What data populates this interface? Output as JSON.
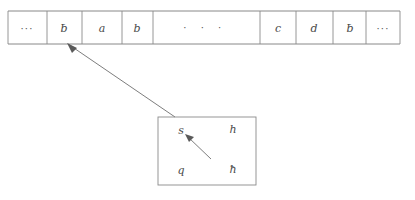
{
  "figure": {
    "kind": "turing-machine-tape-diagram",
    "background_color": "#ffffff",
    "line_color": "#8a8a8a",
    "text_color": "#4a4a4a"
  },
  "tape": {
    "name": "turing-machine-tape",
    "left_x": 8,
    "right_x": 400,
    "top_y": 11,
    "bottom_y": 44,
    "cells": [
      {
        "id": "cell-left-ellipsis",
        "symbol": "···",
        "kind": "ellipsis",
        "x_start": 8,
        "x_end": 47
      },
      {
        "id": "cell-blank-left",
        "symbol": "ƀ",
        "kind": "blank",
        "x_start": 47,
        "x_end": 82
      },
      {
        "id": "cell-a",
        "symbol": "a",
        "kind": "letter",
        "x_start": 82,
        "x_end": 122
      },
      {
        "id": "cell-b",
        "symbol": "b",
        "kind": "letter",
        "x_start": 122,
        "x_end": 153
      },
      {
        "id": "cell-middle-ellipsis",
        "symbol": "· · ·",
        "kind": "wide-ellipsis",
        "x_start": 153,
        "x_end": 260
      },
      {
        "id": "cell-c",
        "symbol": "c",
        "kind": "letter",
        "x_start": 260,
        "x_end": 296
      },
      {
        "id": "cell-d",
        "symbol": "d",
        "kind": "letter",
        "x_start": 296,
        "x_end": 333
      },
      {
        "id": "cell-blank-right",
        "symbol": "ƀ",
        "kind": "blank",
        "x_start": 333,
        "x_end": 366
      },
      {
        "id": "cell-right-ellipsis",
        "symbol": "···",
        "kind": "ellipsis",
        "x_start": 366,
        "x_end": 400
      }
    ]
  },
  "leader": {
    "name": "callout-leader-line",
    "from_x": 68,
    "from_y": 44,
    "to_x": 175,
    "to_y": 117,
    "has_arrowhead_at_tape": true
  },
  "detail_box": {
    "name": "state-detail-box",
    "x": 158,
    "y": 117,
    "width": 98,
    "height": 68,
    "labels": [
      {
        "id": "state-s",
        "text": "s",
        "x": 181,
        "y": 134,
        "position": "top-left"
      },
      {
        "id": "state-h",
        "text": "h",
        "x": 233,
        "y": 133,
        "position": "top-right"
      },
      {
        "id": "state-q",
        "text": "q",
        "x": 181,
        "y": 174,
        "position": "bottom-left"
      },
      {
        "id": "state-hbar",
        "text": "ħ",
        "x": 233,
        "y": 173,
        "position": "bottom-right"
      }
    ],
    "inner_arrow": {
      "name": "state-pointer-arrow",
      "from_x": 211,
      "from_y": 159,
      "to_x": 186,
      "to_y": 135,
      "points_to": "state-s"
    }
  }
}
